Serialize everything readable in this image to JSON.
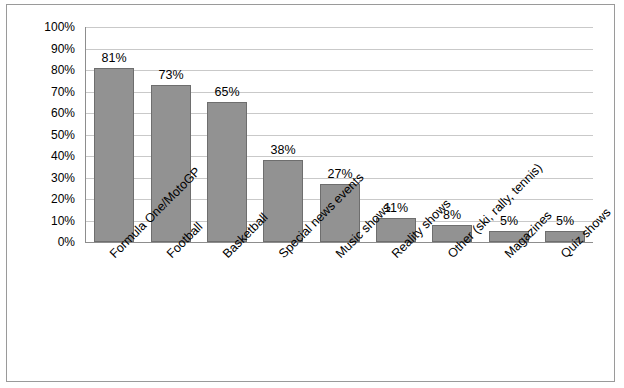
{
  "chart_data": {
    "type": "bar",
    "title": "",
    "subtitle": "",
    "xlabel": "",
    "ylabel": "",
    "categories": [
      "Formula One/MotoGP",
      "Football",
      "Basketball",
      "Special news events",
      "Music shows",
      "Reality shows",
      "Other (ski, rally, tennis)",
      "Magazines",
      "Quiz shows"
    ],
    "values": [
      81,
      73,
      65,
      38,
      27,
      11,
      8,
      5,
      5
    ],
    "data_labels": [
      "81%",
      "73%",
      "65%",
      "38%",
      "27%",
      "11%",
      "8%",
      "5%",
      "5%"
    ],
    "ytick_labels": [
      "100%",
      "90%",
      "80%",
      "70%",
      "60%",
      "50%",
      "40%",
      "30%",
      "20%",
      "10%",
      "0%"
    ],
    "ytick_values": [
      100,
      90,
      80,
      70,
      60,
      50,
      40,
      30,
      20,
      10,
      0
    ],
    "ylim": [
      0,
      100
    ],
    "grid": true,
    "legend": false,
    "legend_position": "none",
    "bar_color": "#929292",
    "bar_border_color": "#6e6e6e",
    "grid_color": "#c9c9c9",
    "axis_color": "#8d8d8d"
  }
}
